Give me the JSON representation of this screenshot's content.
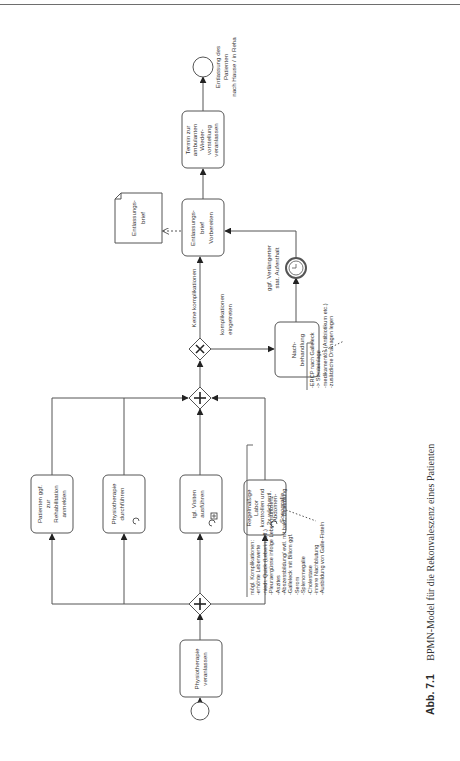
{
  "figure": {
    "caption_label": "Abb. 7.1",
    "caption_text": "BPMN-Model für die Rekonvaleszenz eines Patienten"
  },
  "events": {
    "start": {
      "label": ""
    },
    "end": {
      "label_lines": [
        "Entlassung des",
        "Patienten",
        "nach Hause / in Reha"
      ]
    },
    "timer": {
      "label_lines": [
        "ggf. Verlängerter",
        "stat. Aufenthalt"
      ]
    }
  },
  "tasks": {
    "physio_veranlassen": {
      "lines": [
        "Physiotherapie",
        "veranlassen"
      ]
    },
    "reha_anmelden": {
      "lines": [
        "Patienten ggf.",
        "zur",
        "Rehabilitation",
        "anmelden"
      ]
    },
    "physio_durchfuehren": {
      "lines": [
        "Physiotherapie",
        "durchführen"
      ],
      "marker": "loop"
    },
    "visiten": {
      "lines": [
        "tgl. Visiten",
        "ausführen"
      ],
      "marker": "loop+subprocess"
    },
    "labor": {
      "lines": [
        "Regelmäßige",
        "Labor",
        "kontrollen und",
        "2x wöchentl.",
        "Abdomen-",
        "Sonografie"
      ],
      "marker": "loop"
    },
    "nachbehandlung": {
      "lines": [
        "Nach-",
        "behandlung"
      ]
    },
    "entlassungsbrief": {
      "lines": [
        "Entlassungs-",
        "brief",
        "Vorbereiten"
      ]
    },
    "termin": {
      "lines": [
        "Termin zur",
        "ambulanten",
        "Wieder-",
        "vorstellung",
        "veranlassen"
      ]
    }
  },
  "data_objects": {
    "entlassungsbrief_doc": {
      "lines": [
        "Entlassungs-",
        "brief"
      ]
    }
  },
  "gateways": {
    "split": {
      "type": "parallel",
      "symbol": "+"
    },
    "join": {
      "type": "parallel",
      "symbol": "+"
    },
    "decision": {
      "type": "exclusive",
      "symbol": "×"
    }
  },
  "flows": {
    "no_complications": "Keine komplikationen",
    "complications": [
      "komplikationen",
      "eingetreten"
    ]
  },
  "annotations": {
    "complications": {
      "lines": [
        "mögl. Komplikationen:",
        "-erhöhte Leberwerte",
        "-niedr. Quick (Leberinsuff.)",
        "-Pleuraergüsse infolge Leberinsuffizienz",
        "-Aszites",
        "-Abszessbildung/ evtl. mit bakt. Besiedlung",
        "-Galleleck mit Biliom ggf.",
        "-Serom",
        "-Splenomegalie",
        "-Cholestase",
        "-innere Nachblutung",
        "-Ausbildung von Galle-Fisteln"
      ]
    },
    "treatment": {
      "lines": [
        "-ERCP nach Galleleck",
        " -> Stenteinlage",
        "-medikamentös (Antibiotikum etc.)",
        "-zusätzliche Drainagen legen"
      ]
    }
  },
  "colors": {
    "stroke": "#555555",
    "text": "#333333",
    "background": "#ffffff"
  }
}
